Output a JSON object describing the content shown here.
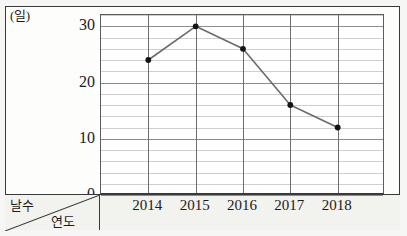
{
  "chart_data": {
    "type": "line",
    "title": "",
    "xlabel": "연도",
    "ylabel": "날수",
    "x_unit": "(년)",
    "y_unit": "(일)",
    "categories": [
      "2014",
      "2015",
      "2016",
      "2017",
      "2018"
    ],
    "values": [
      24,
      30,
      26,
      16,
      12
    ],
    "series": [
      {
        "name": "날수",
        "values": [
          24,
          30,
          26,
          16,
          12
        ]
      }
    ],
    "ylim": [
      0,
      32
    ],
    "y_ticks": [
      0,
      10,
      20,
      30
    ],
    "y_tick_labels": [
      "0",
      "10",
      "20",
      "30"
    ],
    "y_minor_step": 2,
    "grid": true,
    "legend": "none",
    "line_color": "#6b6b6b",
    "marker_color": "#141414",
    "plot_background": "#ffffff",
    "frame_color": "#3a3a3a"
  },
  "labels": {
    "y_unit": "(일)",
    "x_unit": "(년)",
    "corner_top": "날수",
    "corner_bottom": "연도",
    "y_ticks": [
      "0",
      "10",
      "20",
      "30"
    ],
    "x_ticks": [
      "2014",
      "2015",
      "2016",
      "2017",
      "2018"
    ]
  }
}
